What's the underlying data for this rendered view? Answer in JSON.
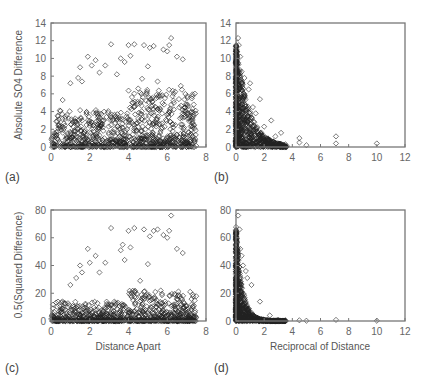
{
  "figure": {
    "panels": [
      {
        "id": "a",
        "label": "(a)"
      },
      {
        "id": "b",
        "label": "(b)"
      },
      {
        "id": "c",
        "label": "(c)"
      },
      {
        "id": "d",
        "label": "(d)"
      }
    ]
  },
  "chart_data": [
    {
      "panel": "(a)",
      "type": "scatter",
      "marker": "open-diamond",
      "title": "",
      "xlabel": "",
      "ylabel": "Absolute SO4 Difference",
      "xlim": [
        0,
        8
      ],
      "ylim": [
        0,
        14
      ],
      "xticks": [
        "0",
        "2",
        "4",
        "6",
        "8"
      ],
      "yticks": [
        "0",
        "2",
        "4",
        "6",
        "8",
        "10",
        "12",
        "14"
      ],
      "grid": false,
      "description": "Dense cloud of points for x 0-7.5, y mostly 0-4 with sparser points up to ~12.3",
      "x": [
        0.6,
        1.0,
        1.4,
        1.5,
        1.6,
        1.9,
        2.1,
        2.3,
        2.5,
        2.8,
        3.1,
        3.4,
        3.6,
        3.8,
        4.0,
        4.1,
        4.3,
        4.5,
        4.7,
        4.8,
        5.0,
        5.1,
        5.3,
        5.5,
        5.8,
        6.0,
        6.1,
        6.2,
        6.5,
        6.7,
        6.8,
        7.0,
        7.2,
        7.4
      ],
      "y": [
        5.3,
        7.2,
        7.8,
        9.0,
        7.4,
        10.2,
        9.2,
        9.8,
        8.4,
        9.2,
        11.6,
        8.2,
        10.0,
        9.6,
        11.5,
        10.3,
        11.6,
        6.6,
        7.7,
        11.5,
        9.1,
        11.2,
        11.4,
        7.4,
        11.0,
        10.8,
        11.5,
        12.3,
        10.2,
        6.9,
        9.9,
        4.8,
        3.0,
        2.1
      ]
    },
    {
      "panel": "(b)",
      "type": "scatter",
      "marker": "open-diamond",
      "title": "",
      "xlabel": "",
      "ylabel": "",
      "xlim": [
        0,
        12
      ],
      "ylim": [
        0,
        14
      ],
      "xticks": [
        "0",
        "2",
        "4",
        "6",
        "8",
        "10",
        "12"
      ],
      "yticks": [
        "0",
        "2",
        "4",
        "6",
        "8",
        "10",
        "12",
        "14"
      ],
      "grid": false,
      "description": "Points concentrated at x<1 with y up to ~12.3, decaying toward x~3.5; sparse outliers near x=4.5, 5, 7, 10",
      "x": [
        0.15,
        0.2,
        0.3,
        0.4,
        0.6,
        0.9,
        1.0,
        1.2,
        1.4,
        1.7,
        2.0,
        2.5,
        2.8,
        3.2,
        3.5,
        4.5,
        4.5,
        5.0,
        7.1,
        7.1,
        10.0
      ],
      "y": [
        12.3,
        11.5,
        10.2,
        8.5,
        7.8,
        6.5,
        7.2,
        4.5,
        3.8,
        5.4,
        2.3,
        3.0,
        1.2,
        1.6,
        0.3,
        1.0,
        0.5,
        0.2,
        1.2,
        0.4,
        0.4
      ]
    },
    {
      "panel": "(c)",
      "type": "scatter",
      "marker": "open-diamond",
      "title": "",
      "xlabel": "Distance Apart",
      "ylabel": "0.5(Squared Difference)",
      "xlim": [
        0,
        8
      ],
      "ylim": [
        0,
        80
      ],
      "xticks": [
        "0",
        "2",
        "4",
        "6",
        "8"
      ],
      "yticks": [
        "0",
        "20",
        "40",
        "60",
        "80"
      ],
      "grid": false,
      "description": "Dense cloud near y 0-10 across x 0-7.5, sparse points up to ~76",
      "x": [
        0.6,
        1.0,
        1.3,
        1.5,
        1.6,
        1.9,
        2.0,
        2.3,
        2.5,
        2.8,
        3.1,
        3.6,
        3.7,
        3.8,
        4.0,
        4.1,
        4.3,
        4.6,
        4.8,
        5.0,
        5.1,
        5.3,
        5.5,
        5.8,
        6.0,
        6.1,
        6.2,
        6.5,
        6.8,
        7.0,
        7.3
      ],
      "y": [
        14,
        26,
        31,
        40,
        35,
        52,
        42,
        47,
        35,
        42,
        67,
        51,
        55,
        44,
        65,
        53,
        67,
        29,
        66,
        41,
        61,
        65,
        66,
        62,
        60,
        65,
        76,
        52,
        49,
        11,
        10
      ]
    },
    {
      "panel": "(d)",
      "type": "scatter",
      "marker": "open-diamond",
      "title": "",
      "xlabel": "Reciprocal of Distance",
      "ylabel": "",
      "xlim": [
        0,
        12
      ],
      "ylim": [
        0,
        80
      ],
      "xticks": [
        "0",
        "2",
        "4",
        "6",
        "8",
        "10",
        "12"
      ],
      "yticks": [
        "0",
        "20",
        "40",
        "60",
        "80"
      ],
      "grid": false,
      "description": "Points concentrated at x<1 with y up to ~76, decaying rapidly; sparse near-zero outliers at x~4.5, 5, 7, 10",
      "x": [
        0.15,
        0.25,
        0.3,
        0.4,
        0.5,
        0.7,
        0.8,
        1.1,
        1.7,
        2.4,
        3.0,
        3.5,
        4.5,
        5.0,
        7.1,
        10.0
      ],
      "y": [
        76,
        66,
        52,
        47,
        40,
        36,
        31,
        26,
        14,
        4,
        1,
        0.5,
        0.5,
        0.2,
        0.8,
        0.2
      ]
    }
  ]
}
